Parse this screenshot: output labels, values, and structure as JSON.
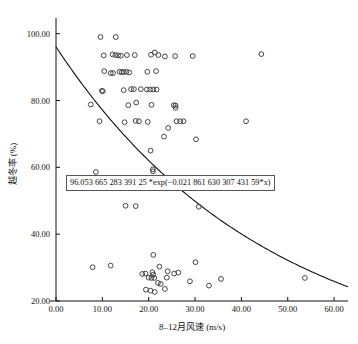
{
  "figure": {
    "title": "",
    "equation_label": "96.053 665 283 391 25 *exp(−0.021 861 630 307 431 59*x)"
  },
  "axes": {
    "x_title": "8–12月风速 (m/s)",
    "y_title": "越冬率 (%)",
    "x_ticks": [
      "0.00",
      "10.00",
      "20.00",
      "30.00",
      "40.00",
      "50.00",
      "60.00"
    ],
    "y_ticks": [
      "20.00",
      "40.00",
      "60.00",
      "80.00",
      "100.00"
    ]
  },
  "chart_data": {
    "type": "scatter",
    "title": "",
    "xlabel": "8–12月风速 (m/s)",
    "ylabel": "越冬率 (%)",
    "xlim": [
      0.0,
      63.0
    ],
    "ylim": [
      20.0,
      102.0
    ],
    "xticks": [
      0,
      10,
      20,
      30,
      40,
      50,
      60
    ],
    "yticks": [
      20,
      40,
      60,
      80,
      100
    ],
    "xtick_labels": [
      "0.00",
      "10.00",
      "20.00",
      "30.00",
      "40.00",
      "50.00",
      "60.00"
    ],
    "ytick_labels": [
      "20.00",
      "40.00",
      "60.00",
      "80.00",
      "100.00"
    ],
    "grid": false,
    "legend": false,
    "annotations": [
      {
        "text": "96.053 665 283 391 25 *exp(−0.021 861 630 307 431 59*x)",
        "x": 5.5,
        "y": 55.5,
        "boxed": true
      }
    ],
    "series": [
      {
        "name": "observations",
        "type": "scatter",
        "marker": "open-circle",
        "points": [
          [
            9.6,
            99.0
          ],
          [
            12.9,
            99.0
          ],
          [
            10.3,
            93.5
          ],
          [
            12.2,
            93.8
          ],
          [
            12.8,
            93.6
          ],
          [
            13.4,
            93.5
          ],
          [
            14.0,
            93.4
          ],
          [
            15.3,
            93.6
          ],
          [
            17.0,
            93.6
          ],
          [
            20.5,
            93.7
          ],
          [
            21.3,
            94.4
          ],
          [
            22.1,
            93.6
          ],
          [
            23.5,
            93.2
          ],
          [
            25.7,
            93.3
          ],
          [
            29.5,
            93.3
          ],
          [
            44.3,
            93.9
          ],
          [
            10.4,
            88.8
          ],
          [
            11.8,
            88.2
          ],
          [
            12.3,
            88.2
          ],
          [
            13.7,
            88.6
          ],
          [
            14.2,
            88.5
          ],
          [
            14.6,
            88.5
          ],
          [
            15.2,
            88.6
          ],
          [
            15.8,
            88.4
          ],
          [
            19.7,
            88.6
          ],
          [
            21.6,
            88.8
          ],
          [
            9.9,
            82.9
          ],
          [
            10.1,
            82.8
          ],
          [
            14.6,
            83.1
          ],
          [
            16.2,
            83.4
          ],
          [
            16.8,
            83.4
          ],
          [
            18.3,
            83.4
          ],
          [
            19.6,
            83.3
          ],
          [
            20.3,
            83.3
          ],
          [
            21.0,
            83.3
          ],
          [
            21.7,
            83.3
          ],
          [
            7.5,
            78.8
          ],
          [
            15.6,
            78.6
          ],
          [
            17.3,
            79.4
          ],
          [
            20.6,
            78.7
          ],
          [
            25.4,
            78.6
          ],
          [
            25.8,
            78.5
          ],
          [
            25.8,
            77.8
          ],
          [
            9.4,
            73.8
          ],
          [
            14.8,
            73.5
          ],
          [
            17.2,
            73.9
          ],
          [
            17.9,
            73.8
          ],
          [
            19.8,
            73.6
          ],
          [
            26.0,
            73.8
          ],
          [
            26.8,
            73.8
          ],
          [
            27.5,
            73.8
          ],
          [
            41.0,
            73.8
          ],
          [
            24.2,
            71.8
          ],
          [
            23.3,
            69.2
          ],
          [
            30.2,
            68.4
          ],
          [
            20.4,
            65.0
          ],
          [
            8.6,
            58.6
          ],
          [
            20.9,
            59.4
          ],
          [
            20.9,
            58.8
          ],
          [
            15.0,
            48.5
          ],
          [
            17.2,
            48.4
          ],
          [
            30.8,
            48.2
          ],
          [
            21.0,
            33.8
          ],
          [
            30.1,
            31.6
          ],
          [
            7.9,
            30.1
          ],
          [
            11.8,
            30.6
          ],
          [
            22.3,
            30.3
          ],
          [
            18.6,
            28.1
          ],
          [
            19.3,
            28.2
          ],
          [
            20.8,
            28.6
          ],
          [
            21.0,
            27.9
          ],
          [
            26.4,
            28.5
          ],
          [
            24.1,
            28.9
          ],
          [
            25.5,
            28.2
          ],
          [
            20.0,
            27.0
          ],
          [
            20.6,
            26.9
          ],
          [
            21.2,
            26.9
          ],
          [
            23.9,
            27.0
          ],
          [
            28.9,
            25.9
          ],
          [
            33.0,
            24.6
          ],
          [
            35.6,
            26.6
          ],
          [
            53.7,
            26.9
          ],
          [
            22.0,
            25.4
          ],
          [
            22.6,
            25.1
          ],
          [
            19.4,
            23.4
          ],
          [
            21.3,
            22.7
          ],
          [
            23.5,
            23.6
          ],
          [
            20.4,
            23.1
          ]
        ]
      },
      {
        "name": "exponential-fit",
        "type": "line",
        "equation": "y = 96.053665283391250 * exp(-0.02186163030743159 * x)",
        "a": 96.05366528339125,
        "b": -0.02186163030743159,
        "x_range": [
          0.0,
          63.0
        ]
      }
    ]
  }
}
